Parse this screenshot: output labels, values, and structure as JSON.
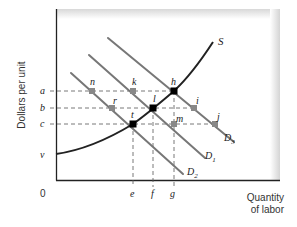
{
  "diagram": {
    "type": "economics-labor-market",
    "axes": {
      "y_label": "Dollars per unit",
      "x_label_line1": "Quantity",
      "x_label_line2": "of labor",
      "origin": "0"
    },
    "y_ticks": [
      {
        "label": "a",
        "y": 91
      },
      {
        "label": "b",
        "y": 108
      },
      {
        "label": "c",
        "y": 124
      },
      {
        "label": "v",
        "y": 155
      }
    ],
    "x_ticks": [
      {
        "label": "e",
        "x": 133
      },
      {
        "label": "f",
        "x": 153
      },
      {
        "label": "g",
        "x": 174
      }
    ],
    "curves": {
      "supply": {
        "label": "S",
        "color": "#222222"
      },
      "demand": [
        {
          "label": "D",
          "sub": "1",
          "color": "#777777"
        },
        {
          "label": "D",
          "sub": "2",
          "color": "#777777"
        },
        {
          "label": "D",
          "sub": "3",
          "color": "#777777"
        }
      ]
    },
    "points": {
      "equilibrium": [
        {
          "label": "h",
          "x": 174,
          "y": 91
        },
        {
          "label": "l",
          "x": 153,
          "y": 108
        },
        {
          "label": "t",
          "x": 133,
          "y": 124
        }
      ],
      "other": [
        {
          "label": "n",
          "x": 92,
          "y": 91
        },
        {
          "label": "k",
          "x": 133,
          "y": 91
        },
        {
          "label": "r",
          "x": 112,
          "y": 108
        },
        {
          "label": "i",
          "x": 194,
          "y": 108
        },
        {
          "label": "m",
          "x": 174,
          "y": 124
        },
        {
          "label": "j",
          "x": 215,
          "y": 124
        }
      ]
    },
    "colors": {
      "axis": "#222222",
      "supply": "#222222",
      "demand": "#777777",
      "dashed": "#555555",
      "point_eq": "#000000",
      "point_other": "#888888"
    }
  }
}
